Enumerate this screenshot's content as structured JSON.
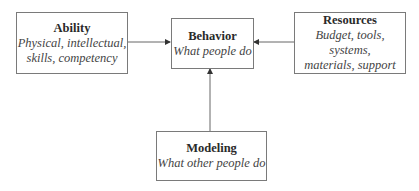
{
  "diagram": {
    "nodes": {
      "ability": {
        "title": "Ability",
        "lines": [
          "Physical, intellectual,",
          "skills, competency"
        ]
      },
      "behavior": {
        "title": "Behavior",
        "lines": [
          "What people do"
        ]
      },
      "resources": {
        "title": "Resources",
        "lines": [
          "Budget, tools, systems,",
          "materials, support"
        ]
      },
      "modeling": {
        "title": "Modeling",
        "lines": [
          "What other people do"
        ]
      }
    },
    "edges": [
      {
        "from": "ability",
        "to": "behavior"
      },
      {
        "from": "resources",
        "to": "behavior"
      },
      {
        "from": "modeling",
        "to": "behavior"
      }
    ],
    "colors": {
      "border": "#7a7a7a",
      "arrow": "#555555",
      "text": "#333333"
    }
  }
}
